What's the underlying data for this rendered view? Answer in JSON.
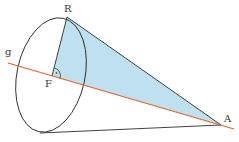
{
  "diagram": {
    "type": "cone-geometry",
    "labels": {
      "R": "R",
      "F": "F",
      "A": "A",
      "g": "g"
    },
    "colors": {
      "axis_line": "#e8642c",
      "triangle_fill": "#bfe0ee",
      "stroke": "#2b2b2b"
    },
    "points": {
      "R": [
        67,
        17
      ],
      "F": [
        52,
        76
      ],
      "A": [
        221,
        125
      ],
      "base_bottom": [
        40,
        133
      ]
    },
    "right_angle_marker_at": "F"
  }
}
